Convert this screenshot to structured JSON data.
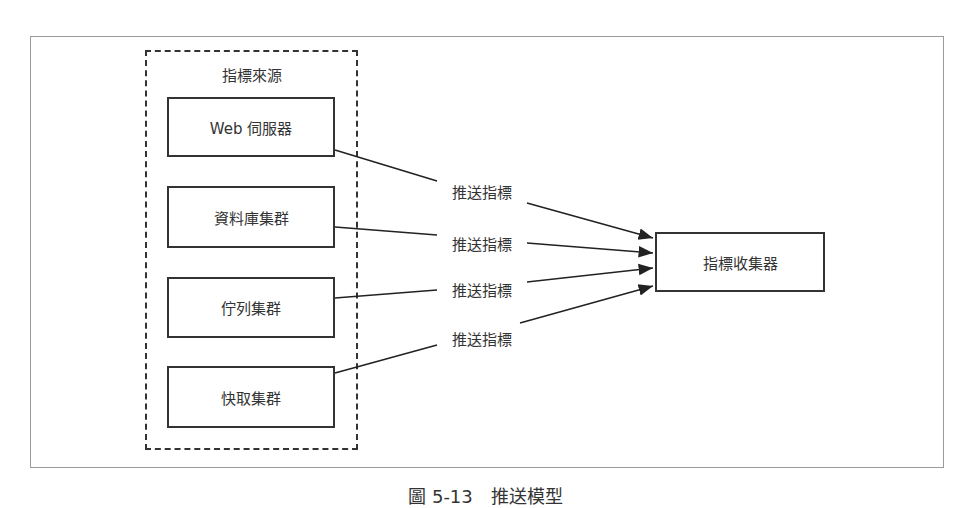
{
  "diagram": {
    "group": {
      "title": "指標來源"
    },
    "sources": [
      {
        "label": "Web 伺服器",
        "x": 167,
        "y": 97,
        "w": 168,
        "h": 60
      },
      {
        "label": "資料庫集群",
        "x": 167,
        "y": 186,
        "w": 168,
        "h": 62
      },
      {
        "label": "佇列集群",
        "x": 167,
        "y": 277,
        "w": 168,
        "h": 61
      },
      {
        "label": "快取集群",
        "x": 167,
        "y": 366,
        "w": 168,
        "h": 62
      }
    ],
    "target": {
      "label": "指標收集器",
      "x": 655,
      "y": 232,
      "w": 170,
      "h": 60
    },
    "edges": [
      {
        "label": "推送指標",
        "from": "Web 伺服器",
        "to": "指標收集器"
      },
      {
        "label": "推送指標",
        "from": "資料庫集群",
        "to": "指標收集器"
      },
      {
        "label": "推送指標",
        "from": "佇列集群",
        "to": "指標收集器"
      },
      {
        "label": "推送指標",
        "from": "快取集群",
        "to": "指標收集器"
      }
    ],
    "caption": "圖 5-13　推送模型"
  }
}
